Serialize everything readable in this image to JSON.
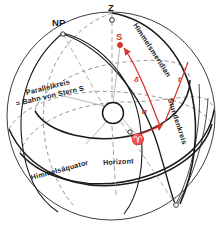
{
  "figure": {
    "language": "de",
    "colors": {
      "ink": "#1a1a1a",
      "accent_red": "#d4352a",
      "hidden_line": "#8a8a8a",
      "background": "#ffffff"
    }
  },
  "labels": {
    "zenith": "Z",
    "north_pole": "NP",
    "star": "S",
    "meridian": "Himmelsmeridian",
    "hour_circle": "Stundenkreis",
    "parallel_circle": "Parallelkreis",
    "star_path": "= Bahn von Stern S",
    "celestial_equator": "Himmelsäquator",
    "horizon": "Horizont",
    "aries": "♈",
    "declination": "δ",
    "right_ascension": "α",
    "hour_angle": "t"
  },
  "annotations": {
    "declination_symbol": "δ",
    "right_ascension_symbol": "α",
    "hour_angle_symbol": "t",
    "vernal_equinox_symbol": "♈",
    "star_symbol": "S",
    "zenith_symbol": "Z",
    "north_pole_symbol": "NP"
  },
  "geometry": {
    "sphere_center_x": 111,
    "sphere_center_y": 116,
    "sphere_radius": 104,
    "earth_center_x": 113,
    "earth_center_y": 113,
    "earth_radius": 10,
    "zenith_x": 112,
    "zenith_y": 22,
    "north_pole_x": 63,
    "north_pole_y": 33,
    "star_x": 120,
    "star_y": 44
  }
}
